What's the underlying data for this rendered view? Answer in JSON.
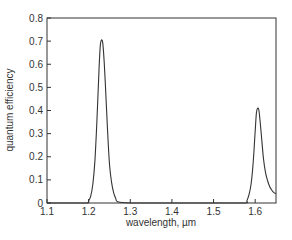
{
  "chart_data": {
    "type": "line",
    "title": "",
    "xlabel": "wavelength, µm",
    "ylabel": "quantum efficiency",
    "xlim": [
      1.1,
      1.65
    ],
    "ylim": [
      0,
      0.8
    ],
    "xticks": [
      1.1,
      1.2,
      1.3,
      1.4,
      1.5,
      1.6
    ],
    "xtick_labels": [
      "1.1",
      "1.2",
      "1.3",
      "1.4",
      "1.5",
      "1.6"
    ],
    "yticks": [
      0,
      0.1,
      0.2,
      0.3,
      0.4,
      0.5,
      0.6,
      0.7,
      0.8
    ],
    "ytick_labels": [
      "0",
      "0.1",
      "0.2",
      "0.3",
      "0.4",
      "0.5",
      "0.6",
      "0.7",
      "0.8"
    ],
    "grid": false,
    "legend": null,
    "series": [
      {
        "name": "quantum efficiency",
        "color": "#333333",
        "x": [
          1.1,
          1.15,
          1.195,
          1.2,
          1.205,
          1.21,
          1.215,
          1.22,
          1.225,
          1.228,
          1.231,
          1.234,
          1.237,
          1.24,
          1.245,
          1.25,
          1.255,
          1.26,
          1.265,
          1.27,
          1.3,
          1.4,
          1.5,
          1.575,
          1.58,
          1.585,
          1.59,
          1.595,
          1.6,
          1.603,
          1.606,
          1.609,
          1.612,
          1.615,
          1.62,
          1.625,
          1.63,
          1.635,
          1.64,
          1.645,
          1.65
        ],
        "y": [
          0,
          0,
          0,
          0.01,
          0.03,
          0.08,
          0.18,
          0.36,
          0.58,
          0.68,
          0.705,
          0.69,
          0.62,
          0.52,
          0.33,
          0.17,
          0.09,
          0.045,
          0.02,
          0.005,
          0,
          0,
          0,
          0,
          0.01,
          0.035,
          0.08,
          0.17,
          0.31,
          0.39,
          0.41,
          0.4,
          0.35,
          0.29,
          0.19,
          0.13,
          0.095,
          0.07,
          0.055,
          0.045,
          0.04
        ]
      }
    ],
    "peaks": [
      {
        "wavelength": 1.23,
        "quantum_efficiency": 0.7
      },
      {
        "wavelength": 1.607,
        "quantum_efficiency": 0.41
      }
    ]
  },
  "style": {
    "axis_color": "#333333",
    "line_color": "#333333",
    "background": "#ffffff"
  }
}
